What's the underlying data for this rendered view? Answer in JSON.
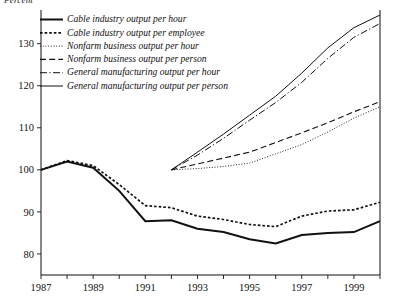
{
  "axis_unit_label": "Percent",
  "chart_data": {
    "type": "line",
    "title": "",
    "subtitle": "",
    "xlabel": "",
    "ylabel": "Percent",
    "grid": false,
    "legend_position": "top-left inside plot",
    "xlim": [
      1987,
      2000
    ],
    "ylim": [
      75,
      138
    ],
    "x_tick_values": [
      1987,
      1988,
      1989,
      1990,
      1991,
      1992,
      1993,
      1994,
      1995,
      1996,
      1997,
      1998,
      1999,
      2000
    ],
    "x_tick_labels": [
      "1987",
      "",
      "1989",
      "",
      "1991",
      "",
      "1993",
      "",
      "1995",
      "",
      "1997",
      "",
      "1999",
      ""
    ],
    "y_tick_values": [
      80,
      90,
      100,
      110,
      120,
      130
    ],
    "y_tick_labels": [
      "80",
      "90",
      "100",
      "110",
      "120",
      "130"
    ],
    "series": [
      {
        "name": "Cable industry output per hour",
        "style": "solid-thick",
        "x": [
          1987,
          1988,
          1989,
          1990,
          1991,
          1992,
          1993,
          1994,
          1995,
          1996,
          1997,
          1998,
          1999,
          2000
        ],
        "values": [
          100.0,
          102.0,
          100.5,
          95.0,
          87.8,
          88.0,
          86.0,
          85.2,
          83.5,
          82.5,
          84.5,
          85.0,
          85.2,
          87.8
        ]
      },
      {
        "name": "Cable industry output per employee",
        "style": "dotted-coarse",
        "x": [
          1987,
          1988,
          1989,
          1990,
          1991,
          1992,
          1993,
          1994,
          1995,
          1996,
          1997,
          1998,
          1999,
          2000
        ],
        "values": [
          100.0,
          102.2,
          101.0,
          96.5,
          91.5,
          91.0,
          89.0,
          88.2,
          87.0,
          86.5,
          89.0,
          90.2,
          90.5,
          92.3
        ]
      },
      {
        "name": "Nonfarm business output per hour",
        "style": "dotted-fine",
        "x": [
          1992,
          1993,
          1994,
          1995,
          1996,
          1997,
          1998,
          1999,
          2000
        ],
        "values": [
          100.0,
          100.3,
          100.8,
          101.6,
          103.8,
          106.0,
          109.0,
          112.3,
          115.0
        ]
      },
      {
        "name": "Nonfarm business output per person",
        "style": "dashed-long",
        "x": [
          1992,
          1993,
          1994,
          1995,
          1996,
          1997,
          1998,
          1999,
          2000
        ],
        "values": [
          100.0,
          101.4,
          102.8,
          104.2,
          106.5,
          108.8,
          111.2,
          113.8,
          116.2
        ]
      },
      {
        "name": "General manufacturing output per hour",
        "style": "dash-dot",
        "x": [
          1992,
          1993,
          1994,
          1995,
          1996,
          1997,
          1998,
          1999,
          2000
        ],
        "values": [
          100.0,
          103.5,
          107.5,
          111.8,
          116.0,
          120.8,
          126.5,
          131.5,
          134.8
        ]
      },
      {
        "name": "General manufacturing output per person",
        "style": "solid-thin",
        "x": [
          1992,
          1993,
          1994,
          1995,
          1996,
          1997,
          1998,
          1999,
          2000
        ],
        "values": [
          100.0,
          104.2,
          108.5,
          113.0,
          117.5,
          123.0,
          129.0,
          133.8,
          136.8
        ]
      }
    ]
  }
}
